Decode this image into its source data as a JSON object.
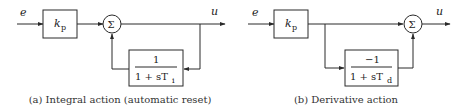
{
  "diagrams": [
    {
      "id": "a",
      "caption": "(a) Integral action (automatic reset)",
      "input_label": "e",
      "output_label": "u",
      "gain_block": {
        "main": "k",
        "sub": "p"
      },
      "summing_symbol": "Σ",
      "feedback_block": {
        "numerator": "1",
        "denominator_prefix": "1 + sT",
        "denominator_sub": "i"
      },
      "topology": "feedback from output through block into summing junction"
    },
    {
      "id": "b",
      "caption": "(b) Derivative action",
      "input_label": "e",
      "output_label": "u",
      "gain_block": {
        "main": "k",
        "sub": "p"
      },
      "summing_symbol": "Σ",
      "parallel_block": {
        "numerator": "−1",
        "denominator_prefix": "1 + sT",
        "denominator_sub": "d"
      },
      "topology": "feedforward branch after gain through block into summing junction"
    }
  ]
}
